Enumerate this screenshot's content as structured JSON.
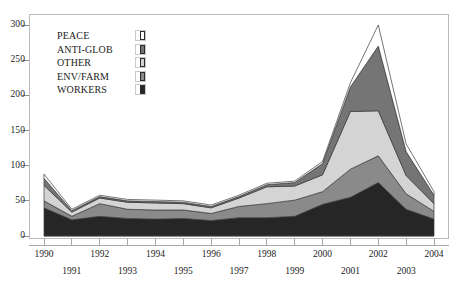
{
  "chart_data": {
    "type": "area",
    "stacked": true,
    "title": "",
    "subtitle": "",
    "xlabel": "",
    "ylabel": "",
    "x": [
      1990,
      1991,
      1992,
      1993,
      1994,
      1995,
      1996,
      1997,
      1998,
      1999,
      2000,
      2001,
      2002,
      2003,
      2004
    ],
    "categories": [
      "1990",
      "1991",
      "1992",
      "1993",
      "1994",
      "1995",
      "1996",
      "1997",
      "1998",
      "1999",
      "2000",
      "2001",
      "2002",
      "2003",
      "2004"
    ],
    "xtick_labels_top": [
      "1990",
      "",
      "1992",
      "",
      "1994",
      "",
      "1996",
      "",
      "1998",
      "",
      "2000",
      "",
      "2002",
      "",
      "2004"
    ],
    "xtick_labels_bottom": [
      "",
      "1991",
      "",
      "1993",
      "",
      "1995",
      "",
      "1997",
      "",
      "1999",
      "",
      "2001",
      "",
      "2003",
      ""
    ],
    "ylim": [
      0,
      300
    ],
    "yticks": [
      0,
      50,
      100,
      150,
      200,
      250,
      300
    ],
    "ytick_labels": [
      "0",
      "50",
      "100",
      "150",
      "200",
      "250",
      "300"
    ],
    "grid": false,
    "legend_position": "upper-left-inside",
    "series": [
      {
        "name": "WORKERS",
        "color": "#262626",
        "values": [
          40,
          23,
          28,
          25,
          24,
          25,
          22,
          26,
          26,
          28,
          45,
          55,
          76,
          38,
          24
        ]
      },
      {
        "name": "ENV/FARM",
        "color": "#8a8a8a",
        "values": [
          10,
          5,
          18,
          13,
          13,
          12,
          10,
          16,
          20,
          23,
          18,
          40,
          38,
          22,
          11
        ]
      },
      {
        "name": "OTHER",
        "color": "#d4d4d4",
        "values": [
          22,
          6,
          8,
          10,
          10,
          9,
          8,
          12,
          24,
          20,
          24,
          82,
          64,
          26,
          11
        ]
      },
      {
        "name": "ANTI-GLOB",
        "color": "#757575",
        "values": [
          10,
          2,
          2,
          2,
          2,
          2,
          2,
          2,
          3,
          5,
          16,
          35,
          92,
          34,
          12
        ]
      },
      {
        "name": "PEACE",
        "color": "#ffffff",
        "values": [
          6,
          2,
          2,
          2,
          2,
          2,
          2,
          2,
          2,
          2,
          3,
          6,
          30,
          11,
          5
        ]
      }
    ],
    "totals": [
      88,
      38,
      58,
      52,
      51,
      50,
      44,
      58,
      75,
      78,
      106,
      218,
      300,
      131,
      63
    ]
  },
  "legend": {
    "items": [
      {
        "label": "PEACE",
        "color": "#ffffff"
      },
      {
        "label": "ANTI-GLOB",
        "color": "#757575"
      },
      {
        "label": "OTHER",
        "color": "#d4d4d4"
      },
      {
        "label": "ENV/FARM",
        "color": "#8a8a8a"
      },
      {
        "label": "WORKERS",
        "color": "#262626"
      }
    ]
  }
}
